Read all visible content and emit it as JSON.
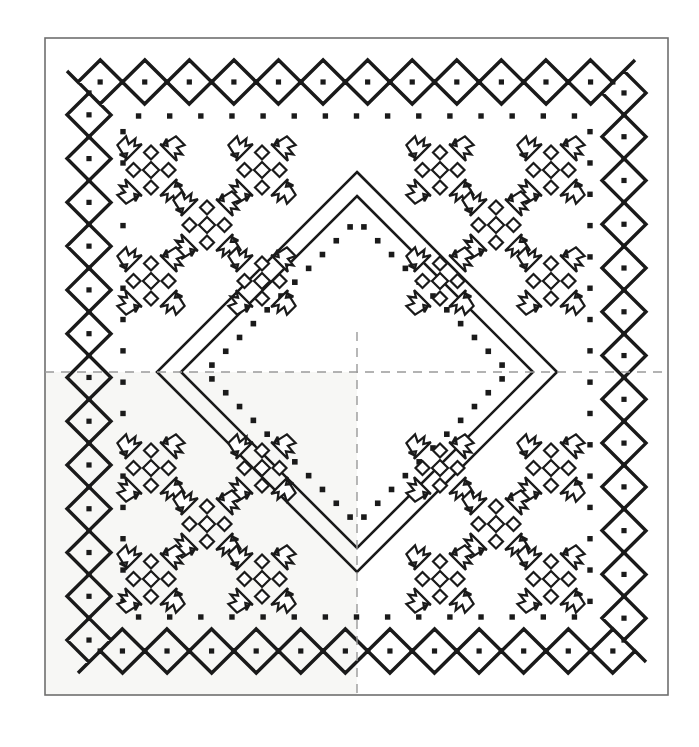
{
  "document": {
    "title": "Square Textile Pattern Diagram",
    "subject": "folk-embroidery-scarf-chart",
    "canvas": {
      "width": 699,
      "height": 747
    },
    "background_color": "#ffffff",
    "ink_color": "#1a1a1a",
    "guide_color": "#9a9a9a",
    "shade_color": "#f7f7f5"
  },
  "frame": {
    "name": "outer-rectangle-frame",
    "x": 45,
    "y": 38,
    "width": 623,
    "height": 657,
    "stroke": "#6f6f6f",
    "stroke_width": 1.6,
    "fill": "none"
  },
  "shaded_quadrant": {
    "name": "lower-left-quadrant-tint",
    "x": 45,
    "y": 372,
    "width": 312,
    "height": 323,
    "fill": "#f7f7f5"
  },
  "center_guides": {
    "name": "registration-crosshair",
    "color": "#9a9a9a",
    "stroke_width": 1.4,
    "dash": "9 7",
    "center_x": 357,
    "center_y": 372,
    "horizontal": {
      "x1": 45,
      "x2": 668,
      "y": 372
    },
    "vertical": {
      "y1": 332,
      "y2": 695,
      "x": 357
    }
  },
  "zigzag_border": {
    "name": "double-chevron-border",
    "stroke": "#1a1a1a",
    "stroke_width": 3.4,
    "outer_inset": 22,
    "row_gap": 22,
    "amplitude": 11,
    "period": 22,
    "rows": 2,
    "dot_size": 5.2,
    "description": "Two interlocking chevron rows forming lozenges, with a square dot centred in each lozenge."
  },
  "dot_border": {
    "name": "inner-dot-row",
    "stroke": "#1a1a1a",
    "dot_size": 5.4,
    "inset": 78,
    "spacing": 30.8,
    "description": "Single row of evenly spaced square dots inside the chevron band."
  },
  "diamond_outer": {
    "name": "outer-diamond-outline",
    "cx": 357,
    "cy": 372,
    "half_width": 200,
    "half_height": 200,
    "stroke": "#1a1a1a",
    "stroke_width": 2.6,
    "fill": "none"
  },
  "diamond_inner": {
    "name": "inner-diamond-outline",
    "cx": 357,
    "cy": 372,
    "half_width": 176,
    "half_height": 176,
    "stroke": "#1a1a1a",
    "stroke_width": 2.6,
    "fill": "none"
  },
  "diamond_dots": {
    "name": "diamond-dotted-inlay",
    "cx": 357,
    "cy": 372,
    "half_width": 152,
    "half_height": 152,
    "dot_size": 5.6,
    "dots_per_side": 11,
    "color": "#1a1a1a"
  },
  "motif": {
    "name": "eight-point-floral-motif",
    "label": "tulip-and-diamond star",
    "cell": 17.5,
    "stroke": "#1a1a1a",
    "stroke_width": 2.2,
    "fill": "#ffffff",
    "components": {
      "corner_tulips": 4,
      "edge_diamonds": 4,
      "center_diamond": 1
    }
  },
  "motif_clusters": [
    {
      "name": "cluster-top-left",
      "corner": "top-left",
      "positions": [
        {
          "cx": 151,
          "cy": 170
        },
        {
          "cx": 262,
          "cy": 170
        },
        {
          "cx": 207,
          "cy": 225
        },
        {
          "cx": 151,
          "cy": 281
        },
        {
          "cx": 262,
          "cy": 281
        }
      ]
    },
    {
      "name": "cluster-top-right",
      "corner": "top-right",
      "positions": [
        {
          "cx": 440,
          "cy": 170
        },
        {
          "cx": 551,
          "cy": 170
        },
        {
          "cx": 496,
          "cy": 225
        },
        {
          "cx": 440,
          "cy": 281
        },
        {
          "cx": 551,
          "cy": 281
        }
      ]
    },
    {
      "name": "cluster-bottom-left",
      "corner": "bottom-left",
      "positions": [
        {
          "cx": 151,
          "cy": 468
        },
        {
          "cx": 262,
          "cy": 468
        },
        {
          "cx": 207,
          "cy": 524
        },
        {
          "cx": 151,
          "cy": 579
        },
        {
          "cx": 262,
          "cy": 579
        }
      ]
    },
    {
      "name": "cluster-bottom-right",
      "corner": "bottom-right",
      "positions": [
        {
          "cx": 440,
          "cy": 468
        },
        {
          "cx": 551,
          "cy": 468
        },
        {
          "cx": 496,
          "cy": 524
        },
        {
          "cx": 440,
          "cy": 579
        },
        {
          "cx": 551,
          "cy": 579
        }
      ]
    }
  ],
  "legend": {
    "motif_count_total": 20,
    "border_bands": 2,
    "symmetry": "four-fold mirror about vertical and horizontal centre axes"
  }
}
